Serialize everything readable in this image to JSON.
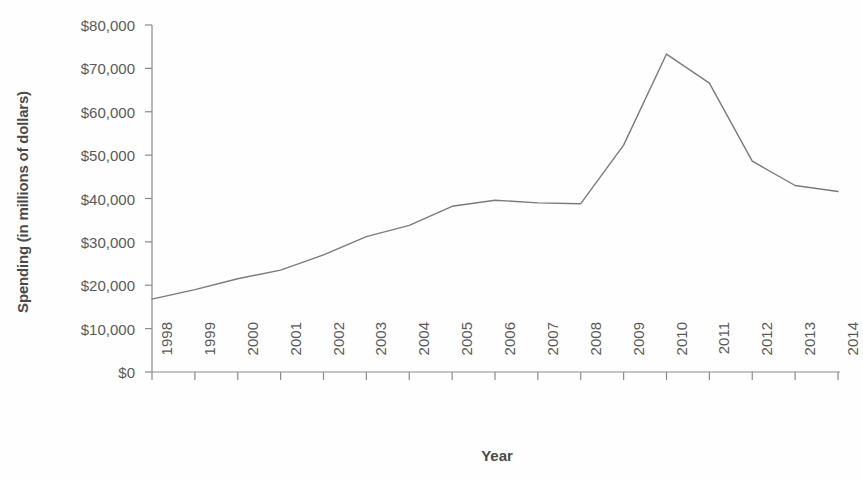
{
  "chart_data": {
    "type": "line",
    "title": "",
    "xlabel": "Year",
    "ylabel": "Spending (in millions of dollars)",
    "categories": [
      "1998",
      "1999",
      "2000",
      "2001",
      "2002",
      "2003",
      "2004",
      "2005",
      "2006",
      "2007",
      "2008",
      "2009",
      "2010",
      "2011",
      "2012",
      "2013",
      "2014"
    ],
    "x": [
      1998,
      1999,
      2000,
      2001,
      2002,
      2003,
      2004,
      2005,
      2006,
      2007,
      2008,
      2009,
      2010,
      2011,
      2012,
      2013,
      2014
    ],
    "values": [
      16800,
      19000,
      21500,
      23500,
      27000,
      31200,
      33800,
      38200,
      39600,
      39000,
      38800,
      52300,
      73300,
      66600,
      48600,
      43000,
      41600
    ],
    "series": [
      {
        "name": "Spending",
        "values": [
          16800,
          19000,
          21500,
          23500,
          27000,
          31200,
          33800,
          38200,
          39600,
          39000,
          38800,
          52300,
          73300,
          66600,
          48600,
          43000,
          41600
        ]
      }
    ],
    "ylim": [
      0,
      80000
    ],
    "xlim": [
      1998,
      2014
    ],
    "y_ticks": [
      0,
      10000,
      20000,
      30000,
      40000,
      50000,
      60000,
      70000,
      80000
    ],
    "y_tick_labels": [
      "$0",
      "$10,000",
      "$20,000",
      "$30,000",
      "$40,000",
      "$50,000",
      "$60,000",
      "$70,000",
      "$80,000"
    ],
    "grid": false,
    "legend": false,
    "line_color": "#7a7a7a",
    "background_color": "#fefefe",
    "axis_color": "#8a8a8a",
    "text_color": "#5a5a5a"
  },
  "axes": {
    "y_title": "Spending (in millions of dollars)",
    "x_title": "Year"
  }
}
